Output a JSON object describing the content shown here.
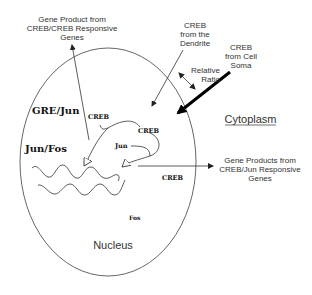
{
  "diagram": {
    "regions": {
      "nucleus": "Nucleus",
      "cytoplasm": "Cytoplasm"
    },
    "external_labels": {
      "creb_creb_products": "Gene Product from\nCREB/CREB Responsive\nGenes",
      "creb_dendrite": "CREB\nfrom the\nDendrite",
      "creb_soma": "CREB\nfrom Cell\nSoma",
      "relative_ratio": "Relative\nRatio",
      "creb_jun_products": "Gene Products from\nCREB/Jun Responsive\nGenes"
    },
    "nuclear_labels": {
      "gre_jun": "GRE/Jun",
      "creb_1": "CREB",
      "creb_2": "CREB",
      "jun": "Jun",
      "jun_fos": "Jun/Fos",
      "creb_3": "CREB",
      "fos": "Fos"
    },
    "colors": {
      "line": "#444444",
      "text": "#333333",
      "background": "#ffffff"
    }
  }
}
